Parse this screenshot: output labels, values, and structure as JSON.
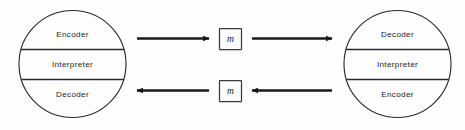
{
  "diagram": {
    "type": "communication-model-diagram",
    "background_color": "#fdfdfd",
    "stroke_color": "#2b2b2b",
    "text_color": "#1c1c1c",
    "left_circle": {
      "name": "sender-model",
      "bands": [
        {
          "id": "encoder",
          "label": "Encoder",
          "position": "top"
        },
        {
          "id": "interpreter",
          "label": "Interpreter",
          "position": "middle"
        },
        {
          "id": "decoder",
          "label": "Decoder",
          "position": "bottom"
        }
      ]
    },
    "right_circle": {
      "name": "receiver-model",
      "bands": [
        {
          "id": "decoder",
          "label": "Decoder",
          "position": "top"
        },
        {
          "id": "interpreter",
          "label": "Interpreter",
          "position": "middle"
        },
        {
          "id": "encoder",
          "label": "Encoder",
          "position": "bottom"
        }
      ]
    },
    "messages": [
      {
        "id": "message-top",
        "label": "m",
        "channel": "outbound"
      },
      {
        "id": "message-bottom",
        "label": "m",
        "channel": "inbound"
      }
    ],
    "arrows": [
      {
        "id": "arrow-top-left",
        "direction": "right",
        "from": "left-circle-encoder",
        "to": "message-top"
      },
      {
        "id": "arrow-top-right",
        "direction": "right",
        "from": "message-top",
        "to": "right-circle-decoder"
      },
      {
        "id": "arrow-bottom-right",
        "direction": "left",
        "from": "right-circle-encoder",
        "to": "message-bottom"
      },
      {
        "id": "arrow-bottom-left",
        "direction": "left",
        "from": "message-bottom",
        "to": "left-circle-decoder"
      }
    ]
  }
}
